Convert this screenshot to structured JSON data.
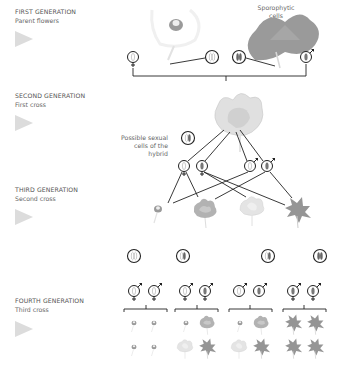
{
  "generations": [
    {
      "title": "FIRST GENERATION",
      "subtitle": "Parent flowers"
    },
    {
      "title": "SECOND  GENERATION",
      "subtitle": "First cross"
    },
    {
      "title": "THIRD GENERATION",
      "subtitle": "Second cross"
    },
    {
      "title": "FOURTH GENERATION",
      "subtitle": "Third cross"
    }
  ],
  "annotations": {
    "sporophytic_line1": "Sporophytic",
    "sporophytic_line2": "cells",
    "hybrid_line1": "Possible sexual",
    "hybrid_line2": "cells of the",
    "hybrid_line3": "hybrid"
  },
  "symbols": {
    "female": "♀",
    "male": "♂"
  },
  "colors": {
    "text": "#555555",
    "arrow": "#dcdcdc",
    "line": "#222222",
    "white_flower": "#e8e8e8",
    "pink_flower": "#a8a8a8",
    "dark_flower": "#8a8a8a"
  }
}
